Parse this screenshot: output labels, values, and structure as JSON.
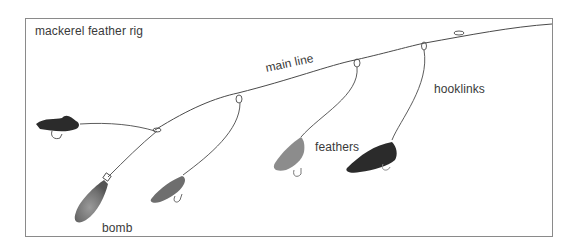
{
  "diagram": {
    "title": "mackerel feather rig",
    "labels": {
      "main_line": "main line",
      "hooklinks": "hooklinks",
      "feathers": "feathers",
      "bomb": "bomb"
    },
    "colors": {
      "line": "#4a4a4a",
      "frame": "#8a8a8a",
      "text": "#3a3a3a",
      "feather_dark": "#2b2b2b",
      "feather_mid": "#6e6e6e",
      "feather_light": "#8c8c8c",
      "bomb": "#7a7a7a"
    },
    "components": [
      {
        "name": "main line",
        "count": 1
      },
      {
        "name": "hooklinks",
        "count": 5
      },
      {
        "name": "feathers",
        "count": 4
      },
      {
        "name": "bomb",
        "count": 1
      }
    ]
  }
}
